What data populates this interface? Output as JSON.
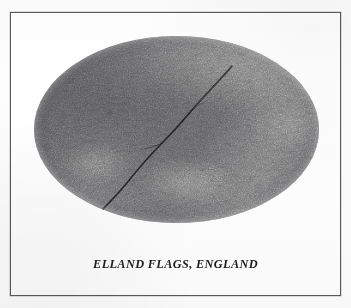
{
  "page": {
    "background_color": "#fdfdfd",
    "width": 351,
    "height": 308
  },
  "figure": {
    "frame": {
      "border_color": "#5a5a5e",
      "background_color": "#ffffff"
    },
    "photo": {
      "shape": "ellipse",
      "subject": "stone-flagstone-surface-photograph",
      "base_color": "#6f6f70",
      "highlight_color": "#d7d5ce",
      "shadow_color": "#3c3c3e",
      "crack_color": "#2a2a2c",
      "alt_text": "Oval halftone photograph of a coarse grained flagstone surface crossed by a diagonal fracture"
    },
    "caption": "ELLAND FLAGS, ENGLAND"
  }
}
